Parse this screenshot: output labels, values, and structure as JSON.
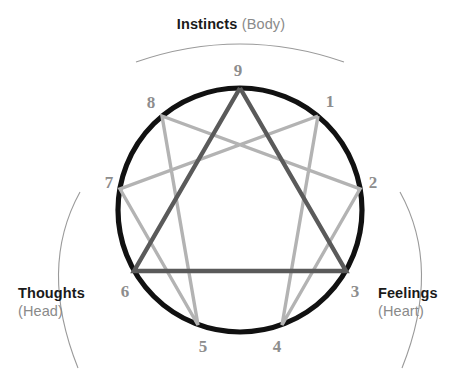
{
  "diagram": {
    "center": {
      "x": 240,
      "y": 210
    },
    "radius": 122,
    "colors": {
      "circle": "#111111",
      "triangle": "#5a5a5a",
      "hexad": "#b3b3b3",
      "number": "#8d8d8d",
      "bracket": "#9a9a9a",
      "label_primary": "#1a1a1a",
      "label_secondary": "#8a8a8a",
      "background": "#ffffff"
    },
    "points": [
      {
        "id": "9",
        "label": "9",
        "angle_deg": 90,
        "x": 240,
        "y": 88,
        "label_x": 238,
        "label_y": 72
      },
      {
        "id": "1",
        "label": "1",
        "angle_deg": 50,
        "x": 318,
        "y": 116,
        "label_x": 330,
        "label_y": 103
      },
      {
        "id": "2",
        "label": "2",
        "angle_deg": 10,
        "x": 360,
        "y": 189,
        "label_x": 373,
        "label_y": 184
      },
      {
        "id": "3",
        "label": "3",
        "angle_deg": 330,
        "x": 346,
        "y": 271,
        "label_x": 355,
        "label_y": 293
      },
      {
        "id": "4",
        "label": "4",
        "angle_deg": 290,
        "x": 282,
        "y": 325,
        "label_x": 277,
        "label_y": 348
      },
      {
        "id": "5",
        "label": "5",
        "angle_deg": 250,
        "x": 198,
        "y": 325,
        "label_x": 203,
        "label_y": 348
      },
      {
        "id": "6",
        "label": "6",
        "angle_deg": 210,
        "x": 134,
        "y": 271,
        "label_x": 125,
        "label_y": 293
      },
      {
        "id": "7",
        "label": "7",
        "angle_deg": 170,
        "x": 120,
        "y": 189,
        "label_x": 109,
        "label_y": 184
      },
      {
        "id": "8",
        "label": "8",
        "angle_deg": 130,
        "x": 162,
        "y": 116,
        "label_x": 151,
        "label_y": 104
      }
    ],
    "triangle_path": [
      "9",
      "3",
      "6",
      "9"
    ],
    "hexad_path": [
      "1",
      "4",
      "2",
      "8",
      "5",
      "7",
      "1"
    ]
  },
  "labels": {
    "instincts": {
      "primary": "Instincts",
      "secondary": "(Body)"
    },
    "thoughts": {
      "primary": "Thoughts",
      "secondary": "(Head)"
    },
    "feelings": {
      "primary": "Feelings",
      "secondary": "(Heart)"
    }
  },
  "brackets": {
    "top": {
      "d": "M 136 62 Q 240 26 344 62"
    },
    "left": {
      "d": "M 80 192 Q 38 268 78 368"
    },
    "right": {
      "d": "M 400 192 Q 442 268 402 368"
    }
  }
}
